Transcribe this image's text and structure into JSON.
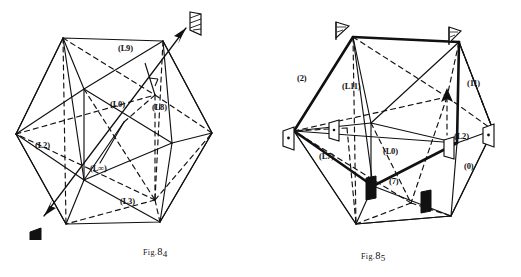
{
  "page": {
    "background": "#ffffff",
    "ink": "#111111"
  },
  "figures": [
    {
      "id": "fig-84",
      "caption_prefix": "Fig.",
      "caption_number": "8",
      "caption_sub": "4",
      "caption_full": "Fig. 84",
      "labels": [
        {
          "name": "label-l9",
          "text": "(L9)",
          "x": 118,
          "y": 44
        },
        {
          "name": "label-l0",
          "text": "(L0)",
          "x": 110,
          "y": 100
        },
        {
          "name": "label-l8",
          "text": "(L8)",
          "x": 152,
          "y": 103
        },
        {
          "name": "label-l2",
          "text": "(L2)",
          "x": 35,
          "y": 141
        },
        {
          "name": "label-linf",
          "text": "(L∞)",
          "x": 90,
          "y": 164
        },
        {
          "name": "label-l3",
          "text": "(L3)",
          "x": 120,
          "y": 197
        }
      ],
      "markers": [
        {
          "name": "flag-hatched-upper-right",
          "style": "hatched",
          "x": 190,
          "y": 12
        },
        {
          "name": "flag-solid-lower-left",
          "style": "solid",
          "x": 30,
          "y": 232
        }
      ]
    },
    {
      "id": "fig-85",
      "caption_prefix": "Fig.",
      "caption_number": "8",
      "caption_sub": "5",
      "caption_full": "Fig. 85",
      "labels": [
        {
          "name": "label-2",
          "text": "(2)",
          "x": 36,
          "y": 74
        },
        {
          "name": "label-l11",
          "text": "(L11)",
          "x": 81,
          "y": 82
        },
        {
          "name": "label-11",
          "text": "(11)",
          "x": 206,
          "y": 79
        },
        {
          "name": "label-l2",
          "text": "(L2)",
          "x": 193,
          "y": 132
        },
        {
          "name": "label-l0",
          "text": "(L0)",
          "x": 122,
          "y": 147
        },
        {
          "name": "label-l7",
          "text": "(L7)",
          "x": 58,
          "y": 152
        },
        {
          "name": "label-0",
          "text": "(0)",
          "x": 203,
          "y": 162
        },
        {
          "name": "label-7",
          "text": "(7)",
          "x": 128,
          "y": 177
        }
      ],
      "markers": [
        {
          "name": "flag-hatched-top-left",
          "style": "hatched-open",
          "x": 75,
          "y": 22
        },
        {
          "name": "flag-hatched-top-right",
          "style": "hatched-open",
          "x": 188,
          "y": 27
        },
        {
          "name": "flag-dot-left",
          "style": "dot",
          "x": 22,
          "y": 131
        },
        {
          "name": "flag-dot-right",
          "style": "dot",
          "x": 222,
          "y": 128
        },
        {
          "name": "flag-dot-inner-left",
          "style": "dot",
          "x": 68,
          "y": 123
        },
        {
          "name": "flag-open-inner-right",
          "style": "open",
          "x": 183,
          "y": 140
        },
        {
          "name": "flag-solid-lower-left",
          "style": "solid",
          "x": 105,
          "y": 178
        },
        {
          "name": "flag-solid-lower-right",
          "style": "solid",
          "x": 160,
          "y": 192
        }
      ]
    }
  ]
}
